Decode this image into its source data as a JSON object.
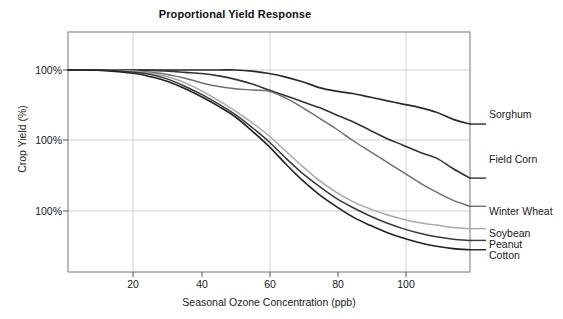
{
  "chart_data": {
    "type": "line",
    "title": "Proportional Yield Response",
    "xlabel": "Seasonal Ozone Concentration (ppb)",
    "ylabel": "Crop Yield (%)",
    "xlim": [
      0,
      120
    ],
    "ylim": [
      0,
      120
    ],
    "xticks": [
      20,
      40,
      60,
      80,
      100
    ],
    "xtick_labels": [
      "20",
      "40",
      "60",
      "80",
      "100"
    ],
    "ytick_labels": [
      "100%",
      "100%",
      "100%"
    ],
    "ytick_values": [
      100,
      70,
      40
    ],
    "grid": true,
    "legend_position": "right-inline-labels",
    "x": [
      0,
      10,
      20,
      25,
      30,
      35,
      40,
      45,
      50,
      55,
      60,
      65,
      70,
      75,
      80,
      85,
      90,
      95,
      100,
      105,
      110,
      115,
      120
    ],
    "series": [
      {
        "name": "Sorghum",
        "color": "#2b2b2b",
        "values": [
          100,
          100,
          100,
          100,
          100,
          100,
          100,
          100,
          100,
          99.5,
          98.5,
          97,
          95,
          92.5,
          91,
          90,
          88.5,
          87,
          85.5,
          84,
          82,
          79,
          77
        ]
      },
      {
        "name": "Field Corn",
        "color": "#333333",
        "values": [
          100,
          100,
          100,
          99.8,
          99.5,
          99,
          98.5,
          97.5,
          96,
          94,
          91.5,
          89,
          86.5,
          84,
          81,
          78,
          74.5,
          71,
          68,
          65,
          62.5,
          58,
          54
        ]
      },
      {
        "name": "Winter Wheat",
        "color": "#6e6e6e",
        "values": [
          100,
          100,
          99.5,
          99,
          98,
          96.5,
          94.5,
          93,
          92,
          91.5,
          91,
          88,
          84,
          79.5,
          75,
          70,
          65.5,
          61,
          56.5,
          52,
          48,
          44.5,
          42
        ]
      },
      {
        "name": "Soybean",
        "color": "#a8a8a8",
        "values": [
          100,
          100,
          99.5,
          98.5,
          97,
          94.5,
          91,
          87,
          82.5,
          77.5,
          72,
          65.5,
          59,
          53,
          48,
          44,
          41,
          38.5,
          36.5,
          35,
          34,
          33,
          32.5
        ]
      },
      {
        "name": "Peanut",
        "color": "#3a3a3a",
        "values": [
          100,
          100,
          99,
          98,
          96,
          93,
          89.5,
          85.5,
          81,
          75.5,
          69.5,
          62.5,
          56,
          50.5,
          45.5,
          41.5,
          38,
          35,
          32.5,
          30.5,
          29,
          28,
          27.5
        ]
      },
      {
        "name": "Cotton",
        "color": "#222222",
        "values": [
          100,
          99.8,
          98.5,
          97,
          95,
          92,
          88.5,
          84.5,
          80,
          74,
          67.5,
          60,
          53,
          47,
          42,
          37.5,
          34,
          31,
          28.5,
          26.5,
          25,
          24,
          23.5
        ]
      }
    ]
  }
}
